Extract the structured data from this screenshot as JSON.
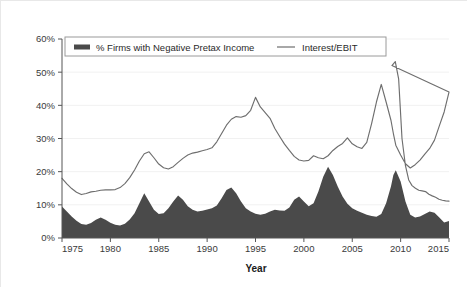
{
  "chart_data": {
    "type": "area",
    "title": "",
    "xlabel": "Year",
    "ylabel": "",
    "xlim": [
      1975,
      2015
    ],
    "ylim": [
      0,
      60
    ],
    "grid": true,
    "legend_position": "top-inside",
    "x_tick_labels": [
      "1975",
      "1980",
      "1985",
      "1990",
      "1995",
      "2000",
      "2005",
      "2010",
      "2015"
    ],
    "x_ticks": [
      1975,
      1980,
      1985,
      1990,
      1995,
      2000,
      2005,
      2010,
      2015
    ],
    "y_tick_labels": [
      "0%",
      "10%",
      "20%",
      "30%",
      "40%",
      "50%",
      "60%"
    ],
    "y_ticks": [
      0,
      10,
      20,
      30,
      40,
      50,
      60
    ],
    "x": [
      1975,
      1975.5,
      1976,
      1976.5,
      1977,
      1977.5,
      1978,
      1978.5,
      1979,
      1979.5,
      1980,
      1980.5,
      1981,
      1981.5,
      1982,
      1982.5,
      1983,
      1983.5,
      1984,
      1984.5,
      1985,
      1985.5,
      1986,
      1986.5,
      1987,
      1987.5,
      1988,
      1988.5,
      1989,
      1989.5,
      1990,
      1990.5,
      1991,
      1991.5,
      1992,
      1992.5,
      1993,
      1993.5,
      1994,
      1994.5,
      1995,
      1995.5,
      1996,
      1996.5,
      1997,
      1997.5,
      1998,
      1998.5,
      1999,
      1999.5,
      2000,
      2000.5,
      2001,
      2001.5,
      2002,
      2002.5,
      2003,
      2003.5,
      2004,
      2004.5,
      2005,
      2005.5,
      2006,
      2006.5,
      2007,
      2007.5,
      2008,
      2008.5,
      2009,
      2009.25,
      2009.5,
      2010,
      2010.5,
      2011,
      2011.5,
      2012,
      2012.5,
      2013,
      2013.5,
      2014,
      2014.5,
      2015
    ],
    "series": [
      {
        "name": "% Firms with Negative Pretax Income",
        "render": "area",
        "color": "#4a4a4a",
        "values": [
          9.5,
          8.0,
          6.5,
          5.2,
          4.2,
          4.0,
          4.5,
          5.5,
          6.2,
          5.5,
          4.6,
          4.0,
          3.8,
          4.3,
          5.6,
          7.5,
          10.5,
          13.5,
          11.0,
          8.5,
          7.2,
          7.5,
          9.0,
          11.0,
          12.8,
          11.5,
          9.6,
          8.5,
          8.0,
          8.2,
          8.6,
          9.0,
          9.8,
          12.0,
          14.5,
          15.2,
          13.5,
          11.0,
          9.0,
          8.0,
          7.3,
          7.0,
          7.3,
          8.0,
          8.5,
          8.3,
          8.2,
          9.2,
          11.5,
          12.5,
          11.0,
          9.6,
          10.5,
          14.0,
          18.5,
          21.5,
          19.0,
          15.5,
          12.5,
          10.3,
          9.0,
          8.2,
          7.6,
          7.0,
          6.6,
          6.4,
          7.2,
          10.5,
          15.5,
          19.0,
          20.4,
          17.0,
          11.0,
          7.0,
          6.2,
          6.5,
          7.2,
          8.0,
          7.6,
          6.2,
          4.7,
          5.1
        ]
      },
      {
        "name": "Interest/EBIT",
        "render": "line",
        "color": "#6e6e6e",
        "values": [
          18.0,
          16.3,
          14.9,
          13.8,
          13.1,
          13.4,
          13.9,
          14.1,
          14.4,
          14.5,
          14.5,
          14.6,
          15.2,
          16.4,
          18.2,
          20.5,
          23.2,
          25.4,
          26.0,
          24.2,
          22.3,
          21.2,
          20.8,
          21.5,
          22.8,
          24.0,
          25.0,
          25.6,
          25.9,
          26.3,
          26.7,
          27.2,
          29.0,
          31.5,
          34.0,
          35.8,
          36.6,
          36.4,
          36.9,
          38.5,
          42.4,
          39.5,
          37.8,
          36.1,
          33.0,
          30.6,
          28.3,
          26.4,
          24.6,
          23.5,
          23.2,
          23.4,
          24.8,
          24.2,
          23.9,
          24.8,
          26.4,
          27.6,
          28.5,
          30.2,
          28.4,
          27.5,
          27.0,
          28.8,
          34.5,
          41.0,
          46.3,
          41.0,
          35.5,
          31.5,
          28.0,
          25.0,
          22.4,
          21.1,
          22.1,
          23.5,
          25.3,
          27.0,
          29.5,
          33.8,
          38.0,
          44.0
        ]
      }
    ],
    "series_notes": {
      "interest_ebit_tail": [
        52.0,
        53.2,
        48.0,
        30.0,
        22.0,
        17.5,
        15.8,
        15.0,
        14.4,
        14.2,
        14.0,
        13.2,
        12.7,
        12.3,
        11.7,
        11.4,
        11.2,
        11.1
      ],
      "area_peaks": [
        {
          "year": 1983,
          "value": 13.5
        },
        {
          "year": 1986.5,
          "value": 12.8
        },
        {
          "year": 1992.5,
          "value": 15.2
        },
        {
          "year": 2002.5,
          "value": 21.5
        },
        {
          "year": 2009.5,
          "value": 20.4
        }
      ],
      "line_peaks": [
        {
          "year": 1983.5,
          "value": 26.0
        },
        {
          "year": 1991.5,
          "value": 42.4
        },
        {
          "year": 2001.8,
          "value": 46.3
        },
        {
          "year": 2009.2,
          "value": 53.2
        }
      ]
    }
  },
  "legend": {
    "entries": [
      {
        "label": "% Firms with Negative Pretax Income",
        "marker": "swatch",
        "color": "#4a4a4a"
      },
      {
        "label": "Interest/EBIT",
        "marker": "line",
        "color": "#6e6e6e"
      }
    ]
  },
  "axes": {
    "x_title": "Year",
    "y_title": ""
  },
  "colors": {
    "area_fill": "#4a4a4a",
    "line_stroke": "#6e6e6e",
    "axis": "#555555",
    "grid": "#f1f1f1",
    "text": "#2a2a2a",
    "background": "#ffffff",
    "frame_border": "#e8e8e8"
  }
}
